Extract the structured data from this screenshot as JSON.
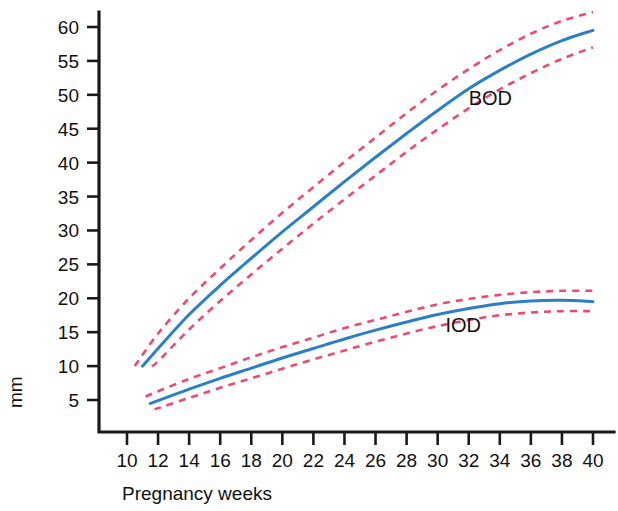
{
  "chart_data": {
    "type": "line",
    "title": "",
    "xlabel": "Pregnancy weeks",
    "ylabel": "mm",
    "xlim": [
      9,
      41
    ],
    "ylim": [
      0,
      62
    ],
    "grid": false,
    "legend_position": "inline-annotation",
    "x_ticks": [
      10,
      12,
      14,
      16,
      18,
      20,
      22,
      24,
      26,
      28,
      30,
      32,
      34,
      36,
      38,
      40
    ],
    "y_ticks": [
      5,
      10,
      15,
      20,
      25,
      30,
      35,
      40,
      45,
      50,
      55,
      60
    ],
    "x_tick_labels": [
      "10",
      "12",
      "14",
      "16",
      "18",
      "20",
      "22",
      "24",
      "26",
      "28",
      "30",
      "32",
      "34",
      "36",
      "38",
      "40"
    ],
    "y_tick_labels": [
      "5",
      "10",
      "15",
      "20",
      "25",
      "30",
      "35",
      "40",
      "45",
      "50",
      "55",
      "60"
    ],
    "annotations": [
      {
        "text": "BOD",
        "x": 32.0,
        "y": 48.5
      },
      {
        "text": "IOD",
        "x": 30.5,
        "y": 15.0
      }
    ],
    "colors": {
      "mean_line": "#2b7fc4",
      "limit_line": "#ec4a72",
      "axis": "#1a1a1a",
      "text": "#111111",
      "background": "#ffffff"
    },
    "series": [
      {
        "name": "BOD",
        "label": "BOD",
        "role": "mean",
        "color": "#2b7fc4",
        "style": "solid",
        "x": [
          11,
          12,
          14,
          16,
          18,
          20,
          22,
          24,
          26,
          28,
          30,
          32,
          34,
          36,
          38,
          40
        ],
        "values": [
          10.0,
          12.6,
          17.6,
          21.9,
          25.9,
          29.8,
          33.5,
          37.2,
          40.8,
          44.3,
          47.7,
          50.9,
          53.6,
          56.0,
          58.0,
          59.5
        ]
      },
      {
        "name": "BOD upper limit",
        "label": "BOD +2SD",
        "role": "upper",
        "color": "#ec4a72",
        "style": "dashed",
        "x": [
          10.5,
          12,
          14,
          16,
          18,
          20,
          22,
          24,
          26,
          28,
          30,
          32,
          34,
          36,
          38,
          40
        ],
        "values": [
          10.0,
          14.8,
          20.0,
          24.4,
          28.6,
          32.6,
          36.4,
          40.1,
          43.7,
          47.3,
          50.7,
          53.8,
          56.6,
          59.0,
          60.9,
          62.2
        ]
      },
      {
        "name": "BOD lower limit",
        "label": "BOD -2SD",
        "role": "lower",
        "color": "#ec4a72",
        "style": "dashed",
        "x": [
          11.6,
          12,
          14,
          16,
          18,
          20,
          22,
          24,
          26,
          28,
          30,
          32,
          34,
          36,
          38,
          40
        ],
        "values": [
          10.0,
          10.7,
          15.4,
          19.6,
          23.5,
          27.3,
          31.0,
          34.6,
          38.1,
          41.6,
          44.9,
          48.0,
          50.8,
          53.2,
          55.3,
          57.0
        ]
      },
      {
        "name": "IOD",
        "label": "IOD",
        "role": "mean",
        "color": "#2b7fc4",
        "style": "solid",
        "x": [
          11.5,
          12,
          14,
          16,
          18,
          20,
          22,
          24,
          26,
          28,
          30,
          32,
          34,
          36,
          38,
          40
        ],
        "values": [
          4.5,
          4.9,
          6.6,
          8.2,
          9.7,
          11.2,
          12.6,
          14.0,
          15.3,
          16.5,
          17.6,
          18.5,
          19.2,
          19.6,
          19.7,
          19.5
        ]
      },
      {
        "name": "IOD upper limit",
        "label": "IOD +2SD",
        "role": "upper",
        "color": "#ec4a72",
        "style": "dashed",
        "x": [
          11.2,
          12,
          14,
          16,
          18,
          20,
          22,
          24,
          26,
          28,
          30,
          32,
          34,
          36,
          38,
          40
        ],
        "values": [
          5.5,
          6.3,
          8.1,
          9.7,
          11.3,
          12.8,
          14.2,
          15.6,
          16.8,
          18.0,
          19.1,
          19.9,
          20.5,
          20.9,
          21.1,
          21.1
        ]
      },
      {
        "name": "IOD lower limit",
        "label": "IOD -2SD",
        "role": "lower",
        "color": "#ec4a72",
        "style": "dashed",
        "x": [
          11.8,
          12,
          14,
          16,
          18,
          20,
          22,
          24,
          26,
          28,
          30,
          32,
          34,
          36,
          38,
          40
        ],
        "values": [
          3.6,
          3.8,
          5.3,
          6.8,
          8.2,
          9.6,
          11.0,
          12.3,
          13.6,
          14.8,
          15.9,
          16.8,
          17.5,
          17.9,
          18.1,
          18.1
        ]
      }
    ]
  }
}
